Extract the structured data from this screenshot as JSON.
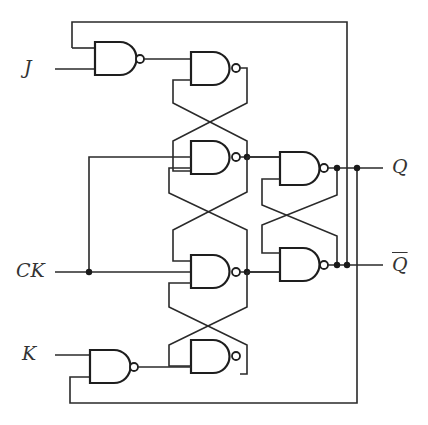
{
  "diagram": {
    "inputs": [
      {
        "id": "J",
        "label": "J"
      },
      {
        "id": "CK",
        "label": "CK"
      },
      {
        "id": "K",
        "label": "K"
      }
    ],
    "outputs": [
      {
        "id": "Q",
        "label": "Q"
      },
      {
        "id": "Qbar",
        "label": "Q"
      }
    ],
    "gates": [
      {
        "id": "g1",
        "type": "NAND",
        "role": "J input gate"
      },
      {
        "id": "g2",
        "type": "NAND",
        "role": "master latch top"
      },
      {
        "id": "g3",
        "type": "NAND",
        "role": "clock gate top"
      },
      {
        "id": "g4",
        "type": "NAND",
        "role": "clock gate bottom"
      },
      {
        "id": "g5",
        "type": "NAND",
        "role": "master latch bottom"
      },
      {
        "id": "g6",
        "type": "NAND",
        "role": "K input gate"
      },
      {
        "id": "g7",
        "type": "NAND",
        "role": "slave latch top (Q)"
      },
      {
        "id": "g8",
        "type": "NAND",
        "role": "slave latch bottom (Q-bar)"
      }
    ],
    "colors": {
      "line": "#1e1e1e",
      "background": "#ffffff"
    }
  }
}
